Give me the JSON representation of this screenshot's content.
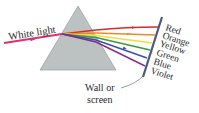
{
  "diagram": {
    "input_label": "White light",
    "screen_label_line1": "Wall or",
    "screen_label_line2": "screen",
    "colors_labels": [
      "Red",
      "Orange",
      "Yellow",
      "Green",
      "Blue",
      "Violet"
    ],
    "ray_colors": {
      "white_light": "#e0306e",
      "red": "#d92a2a",
      "orange": "#e98a2a",
      "yellow": "#f2dd3a",
      "green": "#3a9a3a",
      "blue": "#3a4fa8",
      "violet": "#8a2a8a"
    },
    "prism_fill": "#bcc1c1",
    "screen_color": "#4a5a78"
  }
}
